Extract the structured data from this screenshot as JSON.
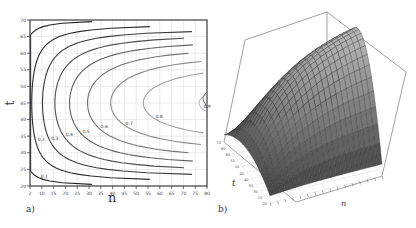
{
  "chart_data": [
    {
      "panel": "a)",
      "type": "contour",
      "xlabel": "n",
      "ylabel": "t",
      "xlim": [
        2,
        80
      ],
      "ylim": [
        20,
        70
      ],
      "x_ticks": [
        "2",
        "10",
        "15",
        "20",
        "25",
        "30",
        "35",
        "40",
        "45",
        "50",
        "55",
        "60",
        "65",
        "70",
        "75",
        "80"
      ],
      "y_ticks": [
        "20",
        "25",
        "30",
        "35",
        "40",
        "45",
        "50",
        "55",
        "60",
        "65",
        "70"
      ],
      "grid": true,
      "contour_levels": [
        0.1,
        0.2,
        0.3,
        0.4,
        0.5,
        0.6,
        0.7,
        0.8,
        0.9
      ],
      "contour_labels_visible": [
        "0.1",
        "0.2",
        "0.3",
        "0.4",
        "0.5",
        "0.6",
        "0.7",
        "0.8",
        "0.9"
      ],
      "description": "C-shaped contours opening to the right; maximum (~0.9) near n=80, t≈45"
    },
    {
      "panel": "b)",
      "type": "surface3d",
      "xlabel": "n",
      "ylabel": "t",
      "xlim": [
        2,
        80
      ],
      "ylim": [
        20,
        70
      ],
      "t_ticks": [
        "20",
        "25",
        "30",
        "35",
        "40",
        "45",
        "50",
        "55",
        "60",
        "65",
        "70"
      ],
      "z_ticks": [
        "0.1",
        "0.2"
      ],
      "description": "Ridge-shaped surface increasing with n, peaking at mid t (~45)"
    }
  ],
  "panels": {
    "a": {
      "label": "a)",
      "xlabel": "n",
      "ylabel": "t"
    },
    "b": {
      "label": "b)",
      "xlabel": "n",
      "ylabel": "t"
    }
  }
}
